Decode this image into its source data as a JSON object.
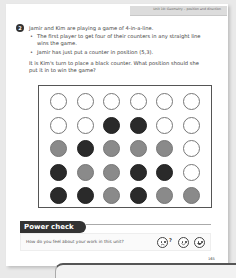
{
  "header": {
    "unit_title": "Unit 10: Geometry – position and direction"
  },
  "question": {
    "number": "2",
    "intro": "Jamir and Kim are playing a game of 4-in-a-line.",
    "bullets": [
      "The first player to get four of their counters in any straight line wins the game.",
      "Jamir has just put a counter in position (5,3)."
    ],
    "prompt": "It is Kim's turn to place a black counter. What position should she put it in to win the game?",
    "bullet_glyph": "•"
  },
  "grid": {
    "columns": 6,
    "rows": 5,
    "cells": [
      [
        "white",
        "white",
        "white",
        "white",
        "white",
        "white"
      ],
      [
        "white",
        "white",
        "black",
        "black",
        "white",
        "white"
      ],
      [
        "grey",
        "black",
        "grey",
        "grey",
        "grey",
        "white"
      ],
      [
        "black",
        "grey",
        "grey",
        "black",
        "black",
        "white"
      ],
      [
        "black",
        "black",
        "grey",
        "black",
        "grey",
        "grey"
      ]
    ],
    "colors": {
      "white": "#ffffff",
      "black": "#2a2a2a",
      "grey": "#8a8a8a"
    }
  },
  "power_check": {
    "label": "Power check",
    "question": "How do you feel about your work in this unit?",
    "faces": [
      "confused-face-icon",
      "smile-face-icon",
      "big-smile-face-icon"
    ],
    "question_mark": "?"
  },
  "footer": {
    "page_number": "165"
  }
}
